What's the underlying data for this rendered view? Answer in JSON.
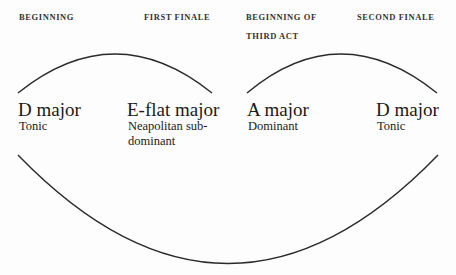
{
  "headers": {
    "beginning": "BEGINNING",
    "first_finale": "FIRST FINALE",
    "beginning_third_act_line1": "BEGINNING OF",
    "beginning_third_act_line2": "THIRD ACT",
    "second_finale": "SECOND FINALE"
  },
  "keys": [
    {
      "key": "D major",
      "function": "Tonic"
    },
    {
      "key": "E-flat major",
      "function_line1": "Neapolitan sub-",
      "function_line2": "dominant"
    },
    {
      "key": "A major",
      "function": "Dominant"
    },
    {
      "key": "D major",
      "function": "Tonic"
    }
  ],
  "colors": {
    "line": "#2a2a2a",
    "text": "#1a1a1a",
    "background": "#fdfdfd"
  }
}
